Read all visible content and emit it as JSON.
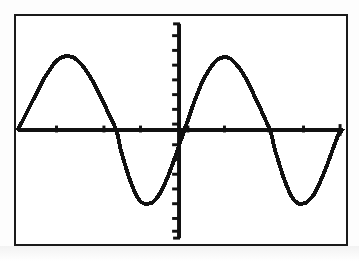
{
  "document": {
    "kind": "graphing-calculator-screen",
    "title": "Graphing calculator display showing a sine curve",
    "background_color": "#ffffff",
    "ink_color": "#111111",
    "frame_border_color": "#1a1a1a"
  },
  "screen": {
    "frame": {
      "x": 14,
      "y": 14,
      "width": 334,
      "height": 232
    },
    "axes": {
      "x_axis": {
        "name": "x-axis",
        "y_pixel": 130,
        "x_start_pixel": 16,
        "x_end_pixel": 342,
        "tick_length": 7,
        "tick_pixels": [
          55,
          103,
          140,
          188,
          225,
          270,
          305
        ],
        "tick_count": 7
      },
      "y_axis": {
        "name": "y-axis",
        "x_pixel": 179,
        "y_start_pixel": 22,
        "y_end_pixel": 240,
        "tick_length": 7,
        "tick_pixels": [
          34,
          49,
          64,
          79,
          94,
          109,
          124,
          145,
          160,
          175,
          190,
          205,
          220,
          233
        ],
        "tick_count": 14
      }
    }
  },
  "chart_data": {
    "type": "line",
    "title": "",
    "subtitle": "",
    "xlabel": "",
    "ylabel": "",
    "grid": false,
    "legend": null,
    "curve_label": "y = sin(x)",
    "amplitude": 1,
    "periods_shown": 2.1,
    "xlim": [
      -2.35,
      2.1
    ],
    "ylim": [
      -1.55,
      1.55
    ],
    "x_tick_values": [
      -1.5,
      -1.0,
      -0.5,
      0.5,
      1.0,
      1.5
    ],
    "y_tick_values": [
      -1.4,
      -1.2,
      -1.0,
      -0.8,
      -0.6,
      -0.4,
      -0.2,
      0.2,
      0.4,
      0.6,
      0.8,
      1.0,
      1.2,
      1.4
    ],
    "key_points": [
      {
        "label": "peak-1",
        "x_pixel": 62,
        "y_pixel": 55
      },
      {
        "label": "zero-1",
        "x_pixel": 100,
        "y_pixel": 130
      },
      {
        "label": "trough-1",
        "x_pixel": 135,
        "y_pixel": 205
      },
      {
        "label": "zero-2",
        "x_pixel": 179,
        "y_pixel": 130
      },
      {
        "label": "peak-2",
        "x_pixel": 220,
        "y_pixel": 56
      },
      {
        "label": "zero-3",
        "x_pixel": 258,
        "y_pixel": 130
      },
      {
        "label": "trough-2",
        "x_pixel": 295,
        "y_pixel": 205
      },
      {
        "label": "right-edge",
        "x_pixel": 344,
        "y_pixel": 143
      }
    ],
    "series": [
      {
        "name": "sine-curve",
        "color": "#111111",
        "stroke_width": 4,
        "x": [
          16,
          20,
          24,
          28,
          32,
          36,
          40,
          44,
          48,
          52,
          56,
          60,
          64,
          68,
          72,
          76,
          80,
          84,
          88,
          92,
          96,
          100,
          104,
          108,
          112,
          116,
          120,
          124,
          128,
          132,
          136,
          140,
          144,
          148,
          152,
          156,
          160,
          164,
          168,
          172,
          176,
          180,
          184,
          188,
          192,
          196,
          200,
          204,
          208,
          212,
          216,
          220,
          224,
          228,
          232,
          236,
          240,
          244,
          248,
          252,
          256,
          260,
          264,
          268,
          272,
          276,
          280,
          284,
          288,
          292,
          296,
          300,
          304,
          308,
          312,
          316,
          320,
          324,
          328,
          332,
          336,
          340,
          344
        ],
        "y": [
          129,
          122,
          114,
          106,
          98,
          90,
          82,
          75,
          69,
          63,
          59,
          56,
          55,
          55,
          56,
          59,
          63,
          68,
          74,
          81,
          89,
          97,
          105,
          114,
          122,
          131,
          150,
          164,
          177,
          188,
          197,
          203,
          205,
          205,
          204,
          200,
          194,
          186,
          177,
          166,
          155,
          143,
          131,
          120,
          108,
          97,
          87,
          78,
          71,
          65,
          60,
          57,
          56,
          56,
          58,
          62,
          67,
          73,
          80,
          88,
          97,
          105,
          114,
          123,
          132,
          150,
          163,
          176,
          187,
          196,
          202,
          205,
          205,
          204,
          200,
          195,
          187,
          178,
          168,
          157,
          146,
          135,
          130
        ]
      }
    ]
  }
}
